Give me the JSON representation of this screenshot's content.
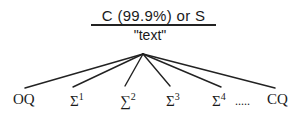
{
  "root": {
    "label": "C (99.9%) or S",
    "sublabel": "\"text\""
  },
  "leaves": [
    {
      "base": "OQ",
      "sup": ""
    },
    {
      "base": "Σ",
      "sup": "1"
    },
    {
      "base": "∑",
      "sup": "2"
    },
    {
      "base": "Σ",
      "sup": "3"
    },
    {
      "base": "Σ",
      "sup": "4"
    },
    {
      "base": ".....",
      "sup": ""
    },
    {
      "base": "CQ",
      "sup": ""
    }
  ],
  "colors": {
    "line": "#222222",
    "text": "#1a1a1a",
    "background": "#ffffff"
  }
}
